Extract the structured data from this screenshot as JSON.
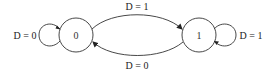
{
  "diagram": {
    "type": "state-machine",
    "states": [
      {
        "id": "s0",
        "label": "0"
      },
      {
        "id": "s1",
        "label": "1"
      }
    ],
    "transitions": [
      {
        "from": "0",
        "to": "0",
        "label": "D = 0"
      },
      {
        "from": "0",
        "to": "1",
        "label": "D = 1"
      },
      {
        "from": "1",
        "to": "0",
        "label": "D = 0"
      },
      {
        "from": "1",
        "to": "1",
        "label": "D = 1"
      }
    ],
    "colors": {
      "stroke": "#333333",
      "text": "#222222",
      "background": "#ffffff"
    }
  }
}
